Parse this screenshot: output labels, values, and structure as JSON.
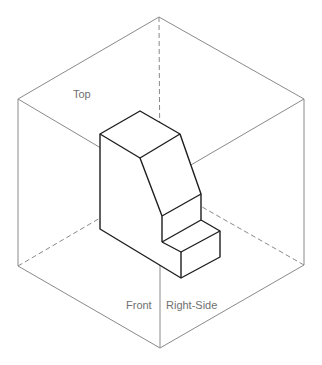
{
  "figure": {
    "type": "glass-box orthographic projection diagram",
    "labels": {
      "top": "Top",
      "front": "Front",
      "right_side": "Right-Side"
    },
    "colors": {
      "background": "#ffffff",
      "box_lines": "#8a8a8a",
      "hidden_lines": "#8a8a8a",
      "object_lines": "#1e1e1e",
      "label_text": "#707070"
    }
  }
}
